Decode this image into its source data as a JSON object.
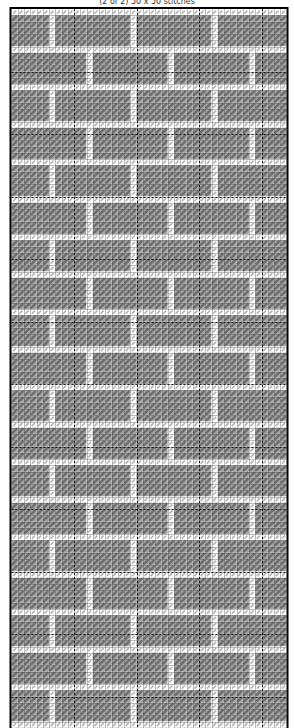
{
  "caption": {
    "text": "(2 of 2) 50 x 50 stitches"
  },
  "chart": {
    "type": "stitch-pattern-grid",
    "frame": {
      "left": 10.5,
      "top": 8,
      "border_color": "#000000",
      "border_width": 2,
      "bottom_cut_off": true
    },
    "grid": {
      "cols": 44,
      "rows": 116,
      "cell_size": 6.25,
      "minor_line_color": "rgba(60,60,60,0.35)",
      "major_line_color": "#1a1a1a",
      "major_every": 10,
      "major_dash": [
        2,
        2
      ]
    },
    "cells": {
      "glyph": "diagonal-stitch",
      "empty": {
        "bg": "#ffffff",
        "glyph_color": "#b4b4b4",
        "glyph_width": 1.6
      },
      "filled": {
        "bg": "#a6a6a6",
        "glyph_color": "#6e6e6e",
        "glyph_width": 2.4
      }
    },
    "pattern": {
      "style": "running-bond-bricks",
      "mortar_rows_every": 6,
      "brick_width_cols": 13,
      "mortar_col_offset_even_course": 6,
      "mortar_col_offset_odd_course": 12,
      "top_row_light": true
    }
  }
}
